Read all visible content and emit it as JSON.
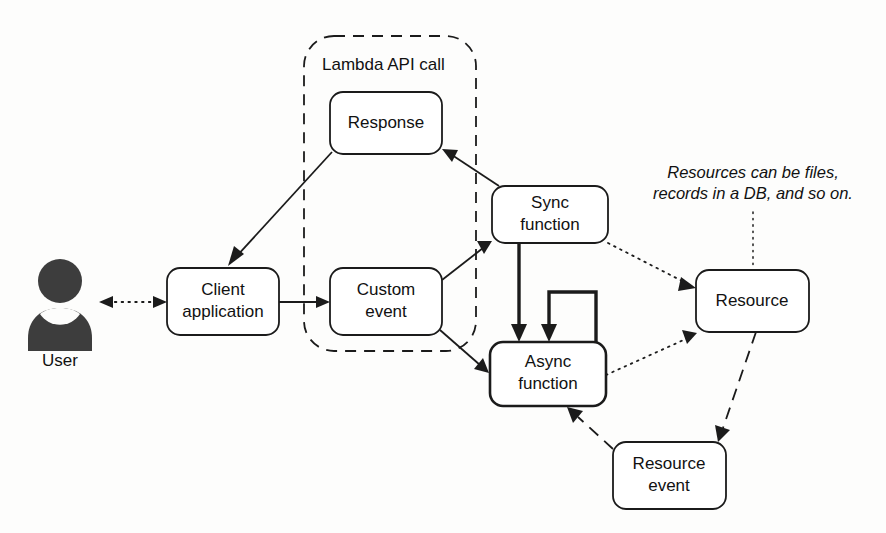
{
  "diagram": {
    "background_color": "#fdfdfc",
    "stroke_color": "#1b1b1b",
    "actor": {
      "name": "user-actor",
      "label": "User",
      "icon": "person-icon",
      "color": "#3d3d3d"
    },
    "group": {
      "name": "lambda-api-call-group",
      "label": "Lambda API call",
      "style": "dashed"
    },
    "nodes": [
      {
        "id": "client-application",
        "label_line1": "Client",
        "label_line2": "application"
      },
      {
        "id": "response",
        "label_line1": "Response",
        "label_line2": ""
      },
      {
        "id": "custom-event",
        "label_line1": "Custom",
        "label_line2": "event"
      },
      {
        "id": "sync-function",
        "label_line1": "Sync",
        "label_line2": "function"
      },
      {
        "id": "async-function",
        "label_line1": "Async",
        "label_line2": "function"
      },
      {
        "id": "resource",
        "label_line1": "Resource",
        "label_line2": ""
      },
      {
        "id": "resource-event",
        "label_line1": "Resource",
        "label_line2": "event"
      }
    ],
    "annotation": {
      "name": "resources-annotation",
      "line1": "Resources can be files,",
      "line2": "records in a DB, and so on.",
      "style": "italic",
      "leader": "dotted"
    },
    "edges": [
      {
        "id": "user-client",
        "from": "User",
        "to": "Client application",
        "style": "dotted",
        "direction": "bidirectional"
      },
      {
        "id": "response-client",
        "from": "Response",
        "to": "Client application",
        "style": "solid",
        "direction": "forward"
      },
      {
        "id": "client-custom-event",
        "from": "Client application",
        "to": "Custom event",
        "style": "solid",
        "direction": "forward"
      },
      {
        "id": "custom-event-sync",
        "from": "Custom event",
        "to": "Sync function",
        "style": "solid",
        "direction": "forward"
      },
      {
        "id": "custom-event-async",
        "from": "Custom event",
        "to": "Async function",
        "style": "solid",
        "direction": "forward"
      },
      {
        "id": "sync-response",
        "from": "Sync function",
        "to": "Response",
        "style": "solid",
        "direction": "forward"
      },
      {
        "id": "sync-async",
        "from": "Sync function",
        "to": "Async function",
        "style": "solid-thick",
        "direction": "forward"
      },
      {
        "id": "async-self-loop",
        "from": "Async function",
        "to": "Async function",
        "style": "solid-thick",
        "direction": "forward"
      },
      {
        "id": "sync-resource",
        "from": "Sync function",
        "to": "Resource",
        "style": "dotted",
        "direction": "forward"
      },
      {
        "id": "async-resource",
        "from": "Async function",
        "to": "Resource",
        "style": "dotted",
        "direction": "forward"
      },
      {
        "id": "resource-resource-event",
        "from": "Resource",
        "to": "Resource event",
        "style": "dashed",
        "direction": "forward"
      },
      {
        "id": "resource-event-async",
        "from": "Resource event",
        "to": "Async function",
        "style": "dashed",
        "direction": "forward"
      }
    ]
  }
}
